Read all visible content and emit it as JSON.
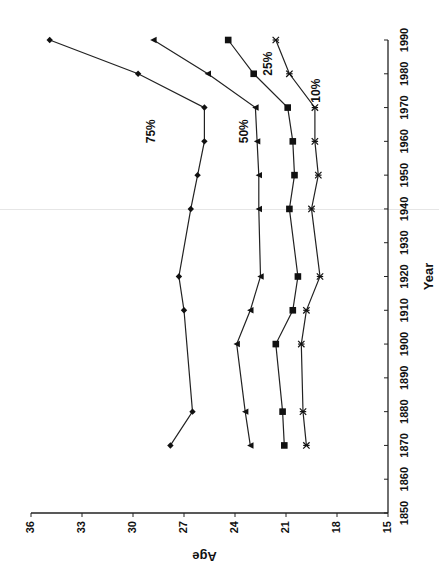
{
  "chart_data": {
    "type": "line",
    "orientation": "rotated-90-clockwise",
    "title": "",
    "xlabel": "Year",
    "ylabel": "Age",
    "x_ticks": [
      1850,
      1860,
      1870,
      1880,
      1890,
      1900,
      1910,
      1920,
      1930,
      1940,
      1950,
      1960,
      1970,
      1980,
      1990
    ],
    "y_ticks": [
      15,
      18,
      21,
      24,
      27,
      30,
      33,
      36
    ],
    "xlim": [
      1850,
      1990
    ],
    "ylim": [
      15,
      36
    ],
    "grid": false,
    "legend": "inline labels",
    "series": [
      {
        "name": "75%",
        "marker": "diamond",
        "x": [
          1870,
          1880,
          1910,
          1920,
          1940,
          1950,
          1960,
          1970,
          1980,
          1990
        ],
        "values": [
          27.8,
          26.5,
          27.0,
          27.3,
          26.6,
          26.2,
          25.8,
          25.8,
          29.7,
          34.9
        ]
      },
      {
        "name": "50%",
        "marker": "triangle",
        "x": [
          1870,
          1880,
          1900,
          1910,
          1920,
          1940,
          1950,
          1960,
          1970,
          1980,
          1990
        ],
        "values": [
          23.1,
          23.4,
          23.9,
          23.1,
          22.5,
          22.6,
          22.6,
          22.7,
          22.8,
          25.6,
          28.8
        ]
      },
      {
        "name": "25%",
        "marker": "square",
        "x": [
          1870,
          1880,
          1900,
          1910,
          1920,
          1940,
          1950,
          1960,
          1970,
          1980,
          1990
        ],
        "values": [
          21.1,
          21.2,
          21.6,
          20.6,
          20.3,
          20.8,
          20.5,
          20.6,
          20.9,
          22.9,
          24.4
        ]
      },
      {
        "name": "10%",
        "marker": "star",
        "x": [
          1870,
          1880,
          1900,
          1910,
          1920,
          1940,
          1950,
          1960,
          1970,
          1980,
          1990
        ],
        "values": [
          19.8,
          20.0,
          20.1,
          19.8,
          19.0,
          19.5,
          19.1,
          19.3,
          19.3,
          20.8,
          21.6
        ]
      }
    ],
    "annotations": [
      {
        "text": "75%",
        "year": 1963,
        "age": 28.9
      },
      {
        "text": "50%",
        "year": 1963,
        "age": 23.4
      },
      {
        "text": "25%",
        "year": 1983,
        "age": 22.0
      },
      {
        "text": "10%",
        "year": 1975,
        "age": 19.2
      }
    ]
  }
}
